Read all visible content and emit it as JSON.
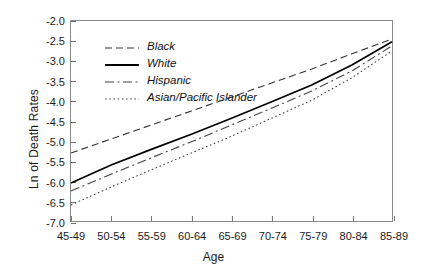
{
  "chart_data": {
    "type": "line",
    "title": "",
    "xlabel": "Age",
    "ylabel": "Ln of Death Rates",
    "categories": [
      "45-49",
      "50-54",
      "55-59",
      "60-64",
      "65-69",
      "70-74",
      "75-79",
      "80-84",
      "85-89"
    ],
    "ylim": [
      -7.0,
      -2.0
    ],
    "ytick_labels": [
      "-2.0",
      "-2.5",
      "-3.0",
      "-3.5",
      "-4.0",
      "-4.5",
      "-5.0",
      "-5.5",
      "-6.0",
      "-6.5",
      "-7.0"
    ],
    "ytick_values": [
      -2.0,
      -2.5,
      -3.0,
      -3.5,
      -4.0,
      -4.5,
      -5.0,
      -5.5,
      -6.0,
      -6.5,
      -7.0
    ],
    "grid": false,
    "legend_position": "upper-left-inside",
    "series": [
      {
        "name": "Black",
        "style": "dashed",
        "color": "#333333",
        "values": [
          -5.3,
          -4.95,
          -4.6,
          -4.25,
          -3.9,
          -3.55,
          -3.2,
          -2.82,
          -2.45
        ]
      },
      {
        "name": "White",
        "style": "solid",
        "color": "#000000",
        "values": [
          -6.05,
          -5.6,
          -5.21,
          -4.83,
          -4.43,
          -4.02,
          -3.6,
          -3.1,
          -2.52
        ]
      },
      {
        "name": "Hispanic",
        "style": "dash-dot",
        "color": "#444444",
        "values": [
          -6.25,
          -5.83,
          -5.42,
          -5.02,
          -4.6,
          -4.18,
          -3.75,
          -3.25,
          -2.62
        ]
      },
      {
        "name": "Asian/Pacific Islander",
        "style": "dotted",
        "color": "#4a4a4a",
        "values": [
          -6.6,
          -6.15,
          -5.72,
          -5.3,
          -4.88,
          -4.43,
          -3.98,
          -3.42,
          -2.75
        ]
      }
    ]
  }
}
